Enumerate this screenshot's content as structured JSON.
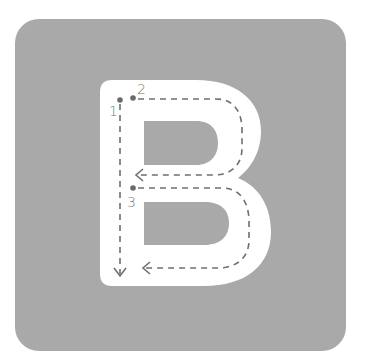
{
  "letter": "B",
  "colors": {
    "page_background": "#ffffff",
    "tile_background": "#a9a9a9",
    "letter_fill": "#ffffff",
    "guide_line": "#6f6f6f",
    "start_dot": "#6a6a6a",
    "number_text": "#777777"
  },
  "strokes": [
    {
      "number": "1",
      "direction": "down",
      "start": "top-left of stem"
    },
    {
      "number": "2",
      "direction": "right-around-left",
      "start": "top of stem, upper bowl"
    },
    {
      "number": "3",
      "direction": "right-around-left",
      "start": "middle of stem, lower bowl"
    }
  ]
}
